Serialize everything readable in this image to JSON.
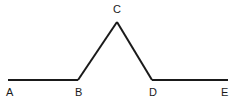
{
  "figure": {
    "type": "line-diagram",
    "background_color": "#ffffff",
    "stroke_color": "#1a1a1a",
    "stroke_width": 2,
    "label_color": "#1a1a1a",
    "label_font_size": 11,
    "points": [
      {
        "id": "A",
        "label": "A",
        "x": 8,
        "y": 80
      },
      {
        "id": "B",
        "label": "B",
        "x": 78,
        "y": 80
      },
      {
        "id": "C",
        "label": "C",
        "x": 117,
        "y": 22
      },
      {
        "id": "D",
        "label": "D",
        "x": 152,
        "y": 80
      },
      {
        "id": "E",
        "label": "E",
        "x": 228,
        "y": 80
      }
    ],
    "segments": [
      {
        "id": "AB",
        "from": "A",
        "to": "B",
        "x1": 8,
        "y1": 80,
        "x2": 78,
        "y2": 80
      },
      {
        "id": "BC",
        "from": "B",
        "to": "C",
        "x1": 78,
        "y1": 80,
        "x2": 117,
        "y2": 22
      },
      {
        "id": "CD",
        "from": "C",
        "to": "D",
        "x1": 117,
        "y1": 22,
        "x2": 152,
        "y2": 80
      },
      {
        "id": "DE",
        "from": "D",
        "to": "E",
        "x1": 152,
        "y1": 80,
        "x2": 228,
        "y2": 80
      }
    ],
    "labels": [
      {
        "id": "A",
        "text": "A",
        "x": 6,
        "y": 87
      },
      {
        "id": "B",
        "text": "B",
        "x": 75,
        "y": 87
      },
      {
        "id": "C",
        "text": "C",
        "x": 113,
        "y": 4
      },
      {
        "id": "D",
        "text": "D",
        "x": 149,
        "y": 87
      },
      {
        "id": "E",
        "text": "E",
        "x": 221,
        "y": 87
      }
    ]
  }
}
